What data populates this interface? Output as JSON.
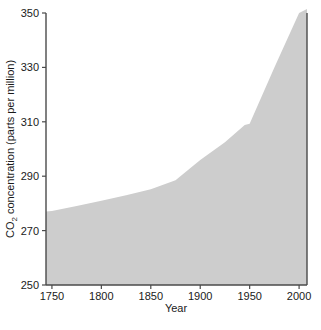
{
  "chart_data": {
    "type": "area",
    "title": "",
    "xlabel": "Year",
    "ylabel": "CO2 concentration (parts per million)",
    "ylabel_main": "concentration (parts per million)",
    "ylabel_species": "CO",
    "ylabel_subscript": "2",
    "x": [
      1750,
      1800,
      1850,
      1900,
      1950,
      2000
    ],
    "values": [
      277,
      281,
      285,
      296,
      309,
      350
    ],
    "series": [
      {
        "name": "CO2 concentration",
        "values": [
          277,
          281,
          285,
          296,
          309,
          350
        ]
      }
    ],
    "x_start": 1744,
    "x_end": 2008,
    "y_start_value": 277,
    "y_end_value": 351,
    "xlim": [
      1744,
      2008
    ],
    "ylim": [
      250,
      350
    ],
    "xticks": [
      1750,
      1800,
      1850,
      1900,
      1950,
      2000
    ],
    "xtick_labels": [
      "1750",
      "1800",
      "1850",
      "1900",
      "1950",
      "2000"
    ],
    "yticks": [
      250,
      270,
      290,
      310,
      330,
      350
    ],
    "ytick_labels": [
      "250",
      "270",
      "290",
      "310",
      "330",
      "350"
    ],
    "grid": false,
    "legend": null,
    "fill_color": "#cdcdcd",
    "axis_color": "#4a4a4a",
    "background_color": "#ffffff",
    "dense_points": [
      {
        "year": 1744,
        "ppm": 277.0
      },
      {
        "year": 1750,
        "ppm": 277.2
      },
      {
        "year": 1775,
        "ppm": 279.0
      },
      {
        "year": 1800,
        "ppm": 281.0
      },
      {
        "year": 1825,
        "ppm": 283.0
      },
      {
        "year": 1850,
        "ppm": 285.2
      },
      {
        "year": 1875,
        "ppm": 288.5
      },
      {
        "year": 1900,
        "ppm": 296.0
      },
      {
        "year": 1925,
        "ppm": 302.5
      },
      {
        "year": 1945,
        "ppm": 308.8
      },
      {
        "year": 1950,
        "ppm": 309.3
      },
      {
        "year": 1975,
        "ppm": 330.0
      },
      {
        "year": 2000,
        "ppm": 350.0
      },
      {
        "year": 2008,
        "ppm": 351.5
      }
    ]
  },
  "axes": {
    "x_title": "Year",
    "y_title_prefix": "CO",
    "y_title_subscript": "2",
    "y_title_suffix": " concentration (parts per million)"
  }
}
